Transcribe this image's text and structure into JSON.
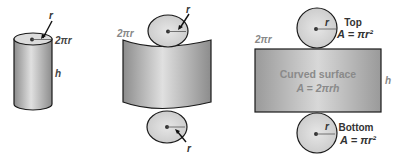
{
  "diagram": {
    "cylinder": {
      "radius_label": "r",
      "circumference_label": "2πr",
      "height_label": "h"
    },
    "unrolled": {
      "top_radius_label": "r",
      "bottom_radius_label": "r",
      "circumference_label": "2πr"
    },
    "net": {
      "circumference_label": "2πr",
      "height_label": "h",
      "top": {
        "name": "Top",
        "formula": "A = πr²",
        "radius_label": "r"
      },
      "bottom": {
        "name": "Bottom",
        "formula": "A = πr²",
        "radius_label": "r"
      },
      "curved_surface": {
        "name": "Curved surface",
        "formula": "A = 2πrh"
      }
    },
    "colors": {
      "shape_fill_light": "#e2e2e2",
      "shape_fill_dark": "#9a9a9a",
      "outline": "#1a1a1a",
      "label_dark": "#333333",
      "label_light": "#8a8a8a"
    }
  }
}
